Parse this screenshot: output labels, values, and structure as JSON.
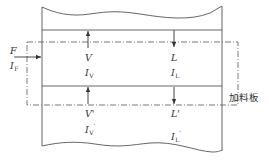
{
  "diagram": {
    "type": "distillation-column-feed-plate",
    "colors": {
      "line": "#555555",
      "text": "#333333",
      "background": "#ffffff"
    },
    "feed": {
      "flow_label": "F",
      "enthalpy_label": "I",
      "enthalpy_sub": "F"
    },
    "upper_section": {
      "vapor": {
        "flow_label": "V",
        "enthalpy_label": "I",
        "enthalpy_sub": "V",
        "direction": "up"
      },
      "liquid": {
        "flow_label": "L",
        "enthalpy_label": "I",
        "enthalpy_sub": "L",
        "direction": "down"
      }
    },
    "lower_section": {
      "vapor": {
        "flow_label": "V'",
        "enthalpy_label": "I",
        "enthalpy_sub": "V",
        "prime": "'",
        "direction": "up"
      },
      "liquid": {
        "flow_label": "L'",
        "enthalpy_label": "I",
        "enthalpy_sub": "L",
        "prime": "'",
        "direction": "down"
      }
    },
    "feed_plate_label": "加料板"
  }
}
